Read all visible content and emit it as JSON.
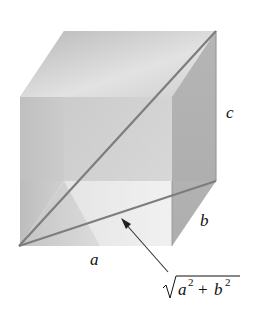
{
  "figure": {
    "type": "rectangular box with face diagonal and space diagonal",
    "colors": {
      "face_light": "#e6e6e6",
      "face_mid": "#c8c8c8",
      "face_dark": "#a9a9a9",
      "diagonal": "#7a7a7a",
      "arrow": "#333333"
    }
  },
  "labels": {
    "edge_a": "a",
    "edge_b": "b",
    "edge_c": "c",
    "diagonal_base": "a",
    "exp1": "2",
    "plus": "+",
    "diagonal_var2": "b",
    "exp2": "2",
    "diagonal_formula": "√(a² + b²)"
  }
}
